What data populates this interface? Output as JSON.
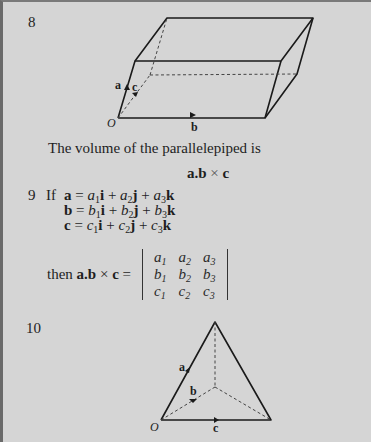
{
  "items": [
    {
      "number": "8",
      "figure": {
        "type": "parallelepiped",
        "labels": {
          "origin": "O",
          "a": "a",
          "b": "b",
          "c": "c"
        }
      },
      "statement": "The volume of the parallelepiped is",
      "formula": {
        "a": "a",
        "dot": ".",
        "b": "b",
        "cross": "×",
        "c": "c"
      }
    },
    {
      "number": "9",
      "if_label": "If",
      "definitions": [
        {
          "vec": "a",
          "eq": "=",
          "c1": "a",
          "s1": "1",
          "u1": "i",
          "c2": "a",
          "s2": "2",
          "u2": "j",
          "c3": "a",
          "s3": "3",
          "u3": "k"
        },
        {
          "vec": "b",
          "eq": "=",
          "c1": "b",
          "s1": "1",
          "u1": "i",
          "c2": "b",
          "s2": "2",
          "u2": "j",
          "c3": "b",
          "s3": "3",
          "u3": "k"
        },
        {
          "vec": "c",
          "eq": "=",
          "c1": "c",
          "s1": "1",
          "u1": "i",
          "c2": "c",
          "s2": "2",
          "u2": "j",
          "c3": "c",
          "s3": "3",
          "u3": "k"
        }
      ],
      "plus": "+",
      "then_label": "then",
      "then_expr": {
        "a": "a",
        "dot": ".",
        "b": "b",
        "cross": "×",
        "c": "c",
        "eq": "="
      },
      "determinant": [
        [
          {
            "v": "a",
            "s": "1"
          },
          {
            "v": "a",
            "s": "2"
          },
          {
            "v": "a",
            "s": "3"
          }
        ],
        [
          {
            "v": "b",
            "s": "1"
          },
          {
            "v": "b",
            "s": "2"
          },
          {
            "v": "b",
            "s": "3"
          }
        ],
        [
          {
            "v": "c",
            "s": "1"
          },
          {
            "v": "c",
            "s": "2"
          },
          {
            "v": "c",
            "s": "3"
          }
        ]
      ]
    },
    {
      "number": "10",
      "figure": {
        "type": "tetrahedron",
        "labels": {
          "origin": "O",
          "a": "a",
          "b": "b",
          "c": "c"
        }
      }
    }
  ]
}
